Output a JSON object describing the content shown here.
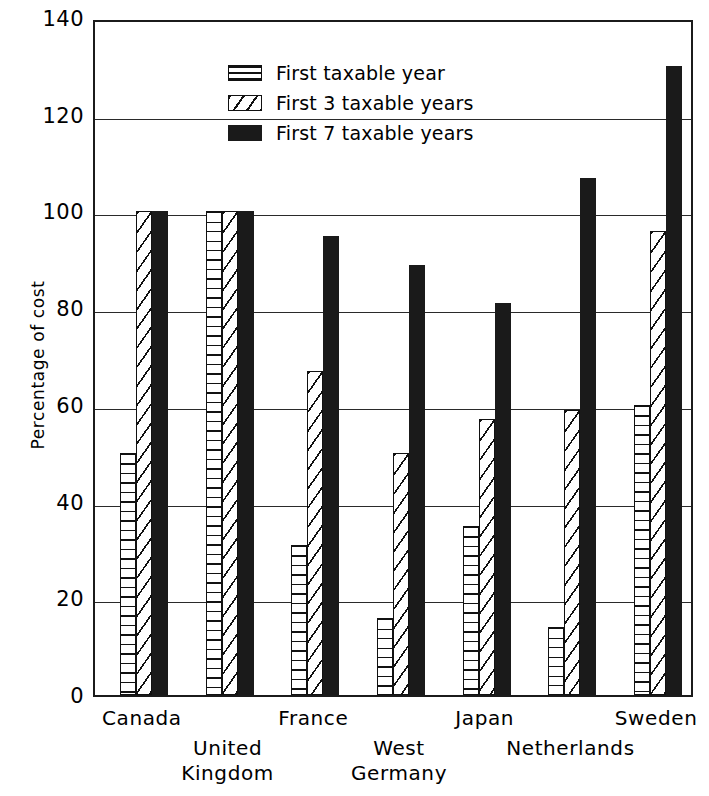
{
  "chart_data": {
    "type": "bar",
    "title": "",
    "xlabel": "",
    "ylabel": "Percentage of cost",
    "ylim": [
      0,
      140
    ],
    "ytick_step": 20,
    "yticks": [
      140,
      120,
      100,
      80,
      60,
      40,
      20,
      0
    ],
    "grid": true,
    "legend_position": "top-center",
    "categories": [
      "Canada",
      "United Kingdom",
      "France",
      "West Germany",
      "Japan",
      "Netherlands",
      "Sweden"
    ],
    "category_label_rows": [
      0,
      1,
      0,
      1,
      0,
      1,
      0
    ],
    "series": [
      {
        "name": "First taxable year",
        "pattern": "horizontal-hatch",
        "values": [
          50,
          100,
          31,
          16,
          35,
          14,
          60
        ]
      },
      {
        "name": "First 3 taxable years",
        "pattern": "diagonal-hatch",
        "values": [
          100,
          100,
          67,
          50,
          57,
          59,
          96
        ]
      },
      {
        "name": "First 7 taxable years",
        "pattern": "solid-black",
        "values": [
          100,
          100,
          95,
          89,
          81,
          107,
          130
        ]
      }
    ],
    "colors": {
      "foreground": "#111111",
      "background": "#ffffff",
      "solid_series": "#1a1a1a"
    }
  },
  "axis": {
    "y_title": "Percentage of cost"
  },
  "legend": {
    "items": [
      {
        "label": "First taxable year"
      },
      {
        "label": "First 3 taxable years"
      },
      {
        "label": "First 7 taxable years"
      }
    ]
  }
}
